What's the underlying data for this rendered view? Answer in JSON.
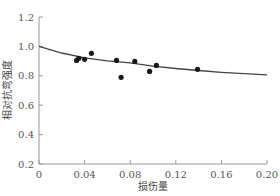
{
  "chart_data": {
    "type": "scatter",
    "title": "",
    "xlabel": "损伤量",
    "ylabel": "相对抗弯强度",
    "xlim": [
      0,
      0.2
    ],
    "ylim": [
      0.2,
      1.2
    ],
    "grid": false,
    "legend": null,
    "x_ticks": [
      "0",
      "0.04",
      "0.08",
      "0.12",
      "0.16",
      "0.20"
    ],
    "y_ticks": [
      "0.2",
      "0.4",
      "0.6",
      "0.8",
      "1.0",
      "1.2"
    ],
    "series": [
      {
        "name": "试验数据",
        "type": "scatter",
        "x": [
          0.033,
          0.035,
          0.04,
          0.046,
          0.068,
          0.072,
          0.084,
          0.097,
          0.103,
          0.139
        ],
        "y": [
          0.905,
          0.919,
          0.912,
          0.953,
          0.905,
          0.79,
          0.898,
          0.83,
          0.871,
          0.844
        ]
      },
      {
        "name": "拟合曲线",
        "type": "line",
        "x": [
          0,
          0.02,
          0.04,
          0.06,
          0.08,
          0.1,
          0.12,
          0.14,
          0.16,
          0.18,
          0.2
        ],
        "y": [
          1.0,
          0.955,
          0.922,
          0.902,
          0.888,
          0.866,
          0.85,
          0.836,
          0.824,
          0.814,
          0.806
        ]
      }
    ]
  }
}
